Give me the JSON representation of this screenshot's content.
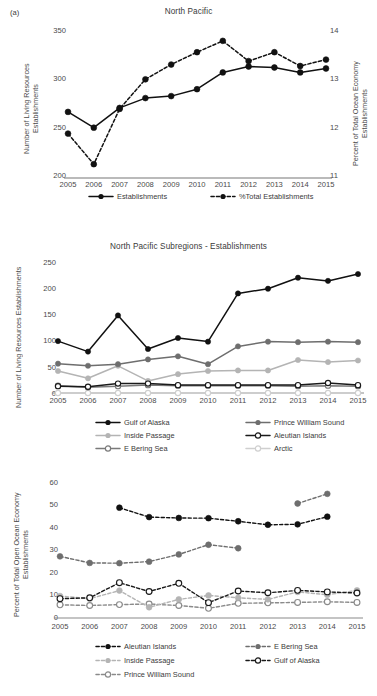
{
  "figure": {
    "subfigure_label": "(a)"
  },
  "charts": [
    {
      "id": "north-pacific",
      "type": "line",
      "title": "North Pacific",
      "ylabel": "Number of Living Resources\nEstablishments",
      "ylabel_line1": "Number of Living Resources",
      "ylabel_line2": "Establishments",
      "y2label_line1": "Percent of Total Ocean Economy",
      "y2label_line2": "Establishments",
      "xlabel": "",
      "categories": [
        "2005",
        "2006",
        "2007",
        "2008",
        "2009",
        "2010",
        "2011",
        "2012",
        "2013",
        "2014",
        "2015"
      ],
      "yticks": [
        200,
        250,
        300,
        350
      ],
      "ylim": [
        200,
        350
      ],
      "y2ticks": [
        11,
        12,
        13,
        14
      ],
      "y2lim": [
        11,
        14
      ],
      "grid": false,
      "legend_position": "bottom",
      "series": [
        {
          "name": "Establishments",
          "axis": "left",
          "style": "solid",
          "marker": "filled",
          "color": "#111111",
          "values": [
            267,
            251,
            271,
            281,
            283,
            290,
            307,
            313,
            312,
            307,
            311
          ]
        },
        {
          "name": "%Total Establishments",
          "axis": "right",
          "style": "dashed",
          "marker": "filled",
          "color": "#111111",
          "values": [
            11.9,
            11.28,
            12.4,
            13.0,
            13.3,
            13.55,
            13.78,
            13.37,
            13.55,
            13.27,
            13.4
          ]
        }
      ]
    },
    {
      "id": "north-pacific-subregions-establishments",
      "type": "line",
      "title": "North Pacific Subregions - Establishments",
      "ylabel_line1": "Number of Living Resources Establishments",
      "categories": [
        "2005",
        "2006",
        "2007",
        "2008",
        "2009",
        "2010",
        "2011",
        "2012",
        "2013",
        "2014",
        "2015"
      ],
      "yticks": [
        0,
        50,
        100,
        150,
        200,
        250
      ],
      "ylim": [
        0,
        250
      ],
      "grid": false,
      "legend_position": "bottom",
      "series": [
        {
          "name": "Gulf of Alaska",
          "style": "solid",
          "marker": "filled",
          "color": "#111111",
          "values": [
            99,
            79,
            148,
            84,
            105,
            98,
            190,
            199,
            220,
            214,
            227
          ]
        },
        {
          "name": "Prince William Sound",
          "style": "solid",
          "marker": "filled",
          "color": "#6e6e6e",
          "values": [
            56,
            52,
            55,
            64,
            70,
            55,
            89,
            98,
            97,
            98,
            97
          ]
        },
        {
          "name": "Inside Passage",
          "style": "solid",
          "marker": "filled",
          "color": "#b4b4b4",
          "values": [
            42,
            28,
            52,
            23,
            36,
            42,
            43,
            43,
            63,
            59,
            62
          ]
        },
        {
          "name": "Aleutian Islands",
          "style": "solid",
          "marker": "open",
          "color": "#1a1a1a",
          "values": [
            13,
            12,
            18,
            18,
            15,
            15,
            15,
            15,
            15,
            19,
            15
          ]
        },
        {
          "name": "E Bering Sea",
          "style": "solid",
          "marker": "open",
          "color": "#7a7a7a",
          "values": [
            14,
            11,
            13,
            15,
            14,
            14,
            14,
            14,
            13,
            14,
            13
          ]
        },
        {
          "name": "Arctic",
          "style": "solid",
          "marker": "open",
          "color": "#cfcfcf",
          "values": [
            0,
            0,
            0,
            0,
            0,
            0,
            0,
            0,
            0,
            0,
            0
          ]
        }
      ]
    },
    {
      "id": "north-pacific-subregions-percent",
      "type": "line",
      "title": "",
      "ylabel_line1": "Percent of Total Open Ocean Economy",
      "ylabel_line2": "Establishments",
      "categories": [
        "2005",
        "2006",
        "2007",
        "2008",
        "2009",
        "2010",
        "2011",
        "2012",
        "2013",
        "2014",
        "2015"
      ],
      "yticks": [
        0,
        10,
        20,
        30,
        40,
        50,
        60
      ],
      "ylim": [
        0,
        62
      ],
      "grid": false,
      "legend_position": "bottom",
      "series": [
        {
          "name": "Aleutian Islands",
          "style": "dashed",
          "marker": "filled",
          "color": "#111111",
          "values": [
            null,
            null,
            50.3,
            46.0,
            45.6,
            45.5,
            44.1,
            42.5,
            42.7,
            46.2,
            null
          ]
        },
        {
          "name": "E Bering Sea",
          "style": "dashed",
          "marker": "filled",
          "color": "#6e6e6e",
          "values": [
            28.1,
            25.1,
            25.0,
            25.7,
            29.0,
            33.4,
            31.8,
            null,
            52.2,
            56.6,
            null
          ]
        },
        {
          "name": "Inside Passage",
          "style": "dashed",
          "marker": "filled",
          "color": "#b4b4b4",
          "values": [
            10.0,
            8.8,
            12.5,
            4.9,
            8.5,
            10.3,
            9.2,
            8.5,
            11.9,
            10.6,
            12.6
          ]
        },
        {
          "name": "Gulf of Alaska",
          "style": "dashed",
          "marker": "open",
          "color": "#1a1a1a",
          "values": [
            8.8,
            9.2,
            16.1,
            12.1,
            15.8,
            7.0,
            12.3,
            11.5,
            12.6,
            11.9,
            11.4
          ]
        },
        {
          "name": "Prince William Sound",
          "style": "dashed",
          "marker": "open",
          "color": "#8a8a8a",
          "values": [
            6.0,
            5.7,
            6.1,
            6.4,
            5.7,
            4.4,
            6.7,
            6.9,
            7.1,
            7.4,
            7.1
          ]
        }
      ]
    }
  ]
}
